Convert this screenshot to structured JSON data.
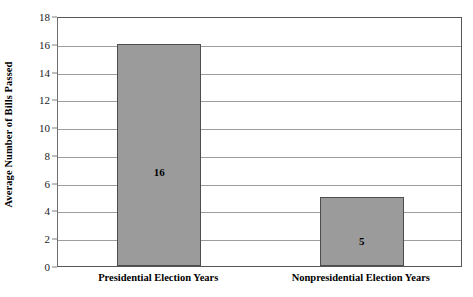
{
  "chart_data": {
    "type": "bar",
    "title": "",
    "subtitle": "",
    "xlabel": "",
    "ylabel": "Average Number of Bills Passed",
    "categories": [
      "Presidential Election Years",
      "Nonpresidential Election Years"
    ],
    "values": [
      16,
      5
    ],
    "value_labels": [
      "16",
      "5"
    ],
    "ylim": [
      0,
      18
    ],
    "y_ticks": [
      0,
      2,
      4,
      6,
      8,
      10,
      12,
      14,
      16,
      18
    ],
    "y_tick_labels": [
      "0",
      "2",
      "4",
      "6",
      "8",
      "10",
      "12",
      "14",
      "16",
      "18"
    ],
    "grid": true,
    "grid_axis": "y",
    "legend": false,
    "legend_position": "none",
    "bar_fill_color": "#9b9b9b",
    "bar_edge_color": "#4d4d4d",
    "gridline_color": "#9d9d9d",
    "axis_color": "#555555",
    "background_color": "#ffffff",
    "text_color": "#000000"
  }
}
